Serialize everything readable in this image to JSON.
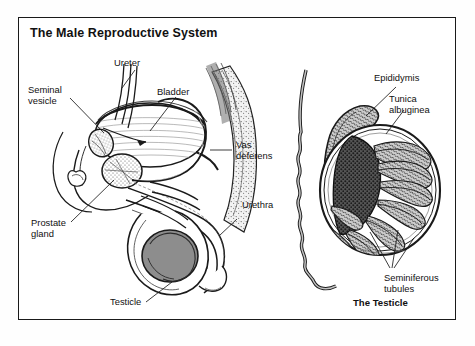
{
  "figure": {
    "title": "The Male Reproductive System",
    "caption_right": "The Testicle",
    "style": {
      "ink": "#1a1a1a",
      "border": "#1a1a1a",
      "page_background": "#ffffff",
      "organ_fill_gray": "#8d8d8d",
      "tissue_fill_gray": "#b9b9b9",
      "light_tint": "#e6e6e6"
    }
  },
  "panels": [
    {
      "id": "left-panel",
      "name": "sagittal-male-pelvis",
      "labels": [
        {
          "id": "ureter",
          "text": "Ureter",
          "lines": [
            "Ureter"
          ]
        },
        {
          "id": "seminal-vesicle",
          "text": "Seminal vesicle",
          "lines": [
            "Seminal",
            "vesicle"
          ]
        },
        {
          "id": "bladder",
          "text": "Bladder",
          "lines": [
            "Bladder"
          ]
        },
        {
          "id": "vas-deferens",
          "text": "Vas deferens",
          "lines": [
            "Vas",
            "deferens"
          ]
        },
        {
          "id": "urethra",
          "text": "Urethra",
          "lines": [
            "Urethra"
          ]
        },
        {
          "id": "prostate-gland",
          "text": "Prostate gland",
          "lines": [
            "Prostate",
            "gland"
          ]
        },
        {
          "id": "testicle",
          "text": "Testicle",
          "lines": [
            "Testicle"
          ]
        }
      ]
    },
    {
      "id": "right-panel",
      "name": "testicle-cross-section",
      "labels": [
        {
          "id": "epididymis",
          "text": "Epididymis",
          "lines": [
            "Epididymis"
          ]
        },
        {
          "id": "tunica-albuginea",
          "text": "Tunica albuginea",
          "lines": [
            "Tunica",
            "albuginea"
          ]
        },
        {
          "id": "seminiferous-tubules",
          "text": "Seminiferous tubules",
          "lines": [
            "Seminiferous",
            "tubules"
          ]
        }
      ]
    }
  ]
}
